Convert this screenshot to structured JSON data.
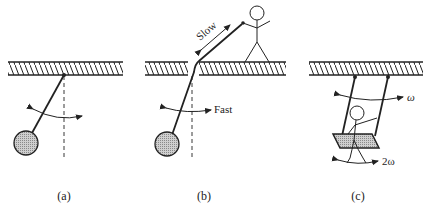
{
  "figure": {
    "panels": [
      {
        "id": "a",
        "caption": "(a)",
        "description": "Simple pendulum swinging from a fixed pivot on a hatched ceiling"
      },
      {
        "id": "b",
        "caption": "(b)",
        "description": "Pendulum whose string passes through a hole in the ceiling; a person pulls the string",
        "labels": {
          "slow": "Slow",
          "fast": "Fast"
        }
      },
      {
        "id": "c",
        "caption": "(c)",
        "description": "Child on a swing hanging from two ropes; swing oscillates at ω while child pumps at 2ω",
        "labels": {
          "omega": "ω",
          "two_omega": "2ω"
        }
      }
    ],
    "colors": {
      "ink": "#222222",
      "bob_fill": "#bdbdbd",
      "background": "#ffffff"
    }
  }
}
